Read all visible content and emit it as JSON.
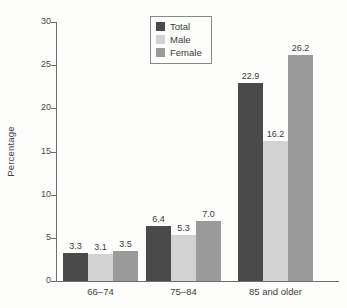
{
  "chart_data": {
    "type": "bar",
    "title": "",
    "xlabel": "",
    "ylabel": "Percentage",
    "ylim": [
      0,
      30
    ],
    "yticks": [
      0,
      5,
      10,
      15,
      20,
      25,
      30
    ],
    "grid": false,
    "legend_position": "top-center",
    "categories": [
      "66–74",
      "75–84",
      "85 and older"
    ],
    "series": [
      {
        "name": "Total",
        "color": "#4a4a4a",
        "values": [
          3.3,
          6.4,
          22.9
        ],
        "labels": [
          "3.3",
          "6.4",
          "22.9"
        ]
      },
      {
        "name": "Male",
        "color": "#d2d2d2",
        "values": [
          3.1,
          5.3,
          16.2
        ],
        "labels": [
          "3.1",
          "5.3",
          "16.2"
        ]
      },
      {
        "name": "Female",
        "color": "#9a9a9a",
        "values": [
          3.5,
          7.0,
          26.2
        ],
        "labels": [
          "3.5",
          "7.0",
          "26.2"
        ]
      }
    ]
  },
  "axis": {
    "y_title": "Percentage",
    "y_tick_labels": [
      "30",
      "25",
      "20",
      "15",
      "10",
      "5",
      "0"
    ],
    "x_tick_labels": [
      "66–74",
      "75–84",
      "85 and older"
    ]
  },
  "legend": {
    "items": [
      {
        "label": "Total",
        "color": "#4a4a4a"
      },
      {
        "label": "Male",
        "color": "#d2d2d2"
      },
      {
        "label": "Female",
        "color": "#9a9a9a"
      }
    ]
  }
}
